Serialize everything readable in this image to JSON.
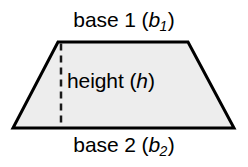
{
  "figure": {
    "name": "trapezoid-area-diagram",
    "shape": "trapezoid",
    "background_color": "#ffffff",
    "fill_color": "#ededed",
    "stroke_color": "#000000",
    "stroke_width": 3,
    "dash_color": "#1a1a1a",
    "dash_width": 2.5,
    "vertices": {
      "top_left": [
        58,
        42
      ],
      "top_right": [
        188,
        42
      ],
      "bottom_right": [
        234,
        128
      ],
      "bottom_left": [
        13,
        128
      ]
    },
    "height_line": {
      "x": 61,
      "y_top": 43,
      "y_bottom": 128,
      "dash_pattern": "7 5"
    }
  },
  "labels": {
    "base1": {
      "text": "base 1 (b",
      "word": "base",
      "number": "1",
      "open_paren": "(",
      "variable": "b",
      "subscript": "1",
      "close_paren": ")",
      "full": "base 1 (b1)"
    },
    "base2": {
      "word": "base",
      "number": "2",
      "open_paren": "(",
      "variable": "b",
      "subscript": "2",
      "close_paren": ")",
      "full": "base 2 (b2)"
    },
    "height": {
      "word": "height",
      "open_paren": "(",
      "variable": "h",
      "close_paren": ")",
      "full": "height (h)"
    }
  }
}
